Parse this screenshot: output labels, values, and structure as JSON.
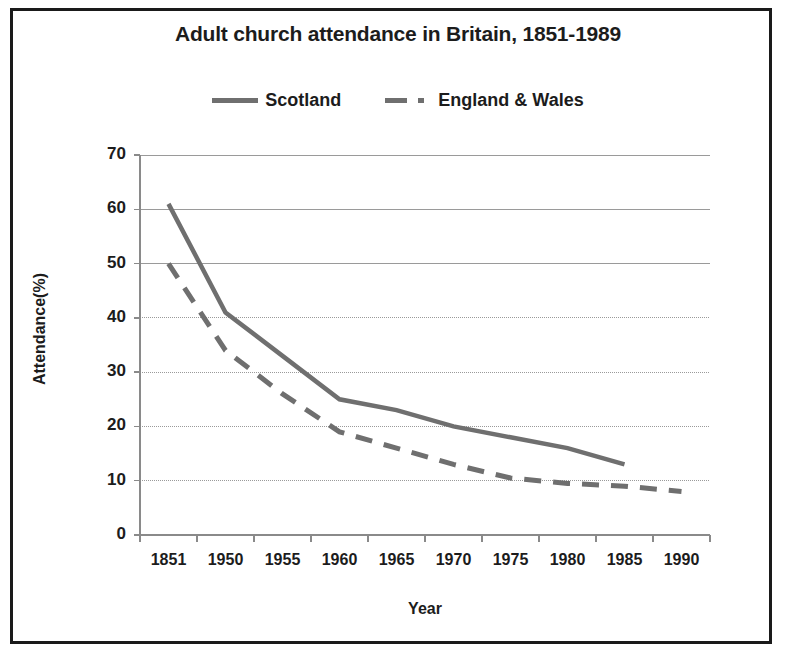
{
  "chart_data": {
    "type": "line",
    "title": "Adult church attendance in Britain, 1851-1989",
    "xlabel": "Year",
    "ylabel": "Attendance(%)",
    "categories": [
      "1851",
      "1950",
      "1955",
      "1960",
      "1965",
      "1970",
      "1975",
      "1980",
      "1985",
      "1990"
    ],
    "ylim": [
      0,
      70
    ],
    "ytick_labels": [
      "70",
      "60",
      "50",
      "40",
      "30",
      "20",
      "10",
      "0"
    ],
    "ytick_values": [
      70,
      60,
      50,
      40,
      30,
      20,
      10,
      0
    ],
    "grid": true,
    "legend_position": "top",
    "series": [
      {
        "name": "Scotland",
        "style": "solid",
        "color": "#6f6f6f",
        "values": [
          61,
          41,
          33,
          25,
          23,
          20,
          18,
          16,
          13,
          null
        ]
      },
      {
        "name": "England & Wales",
        "style": "dashed",
        "color": "#6f6f6f",
        "values": [
          50,
          34,
          26,
          19,
          16,
          13,
          10.5,
          9.5,
          9,
          8
        ]
      }
    ]
  },
  "legend": {
    "entries": [
      {
        "label": "Scotland",
        "style": "solid"
      },
      {
        "label": "England & Wales",
        "style": "dashed"
      }
    ]
  },
  "colors": {
    "line": "#6f6f6f",
    "text": "#1c1c1c",
    "grid": "#9a9a9a",
    "axis": "#8a8a8a",
    "background": "#ffffff",
    "border": "#1a1a1a"
  }
}
